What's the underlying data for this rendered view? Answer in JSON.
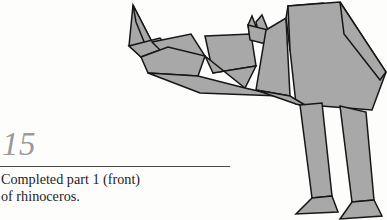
{
  "page": {
    "background_color": "#fdfdfc"
  },
  "step": {
    "number": "15",
    "number_color": "#9a9a9a",
    "rule_color": "#4a4a4a",
    "caption": "Completed part 1 (front)\nof rhinoceros.",
    "caption_color": "#1d1d1d"
  },
  "figure": {
    "name": "origami-rhinoceros-front-half",
    "fill_color": "#a8a8a8",
    "stroke_color": "#161616",
    "stroke_width": 1.5,
    "parts": [
      {
        "name": "horn-upper-spike",
        "points": "133,5 152,42 141,57 129,46"
      },
      {
        "name": "horn-inner-facet",
        "points": "133,5 152,42 147,49 136,22"
      },
      {
        "name": "snout-lower-jaw",
        "points": "129,46 141,57 168,47 160,38"
      },
      {
        "name": "muzzle-top",
        "points": "152,42 191,34 205,56 175,65"
      },
      {
        "name": "muzzle-under",
        "points": "141,57 168,47 205,56 198,76 148,73"
      },
      {
        "name": "cheek-panel",
        "points": "205,36 251,34 256,66 213,73"
      },
      {
        "name": "cheek-lower",
        "points": "205,56 213,73 256,66 245,88"
      },
      {
        "name": "jowl-wedge",
        "points": "148,73 198,76 245,88 280,96 200,93"
      },
      {
        "name": "ear-left-spike",
        "points": "252,16 258,32 250,36 248,25"
      },
      {
        "name": "ear-right-spike",
        "points": "262,15 268,30 259,35 256,22"
      },
      {
        "name": "ear-base",
        "points": "248,25 268,30 266,44 250,40"
      },
      {
        "name": "neck-panel",
        "points": "266,30 286,18 290,96 256,90"
      },
      {
        "name": "shoulder-front",
        "points": "286,18 288,6 323,3 326,40 290,50"
      },
      {
        "name": "body-main",
        "points": "288,6 340,2 386,72 372,110 296,104 290,50"
      },
      {
        "name": "rump-panel",
        "points": "340,2 386,72 380,80 344,34"
      },
      {
        "name": "belly-panel",
        "points": "256,90 290,96 310,108 296,104"
      },
      {
        "name": "leg-front",
        "points": "300,105 322,103 332,196 312,198"
      },
      {
        "name": "leg-rear",
        "points": "340,106 366,112 374,200 352,202"
      },
      {
        "name": "foot-front",
        "points": "312,198 332,196 338,212 296,214"
      },
      {
        "name": "foot-rear",
        "points": "352,202 374,200 382,216 340,219"
      }
    ]
  }
}
